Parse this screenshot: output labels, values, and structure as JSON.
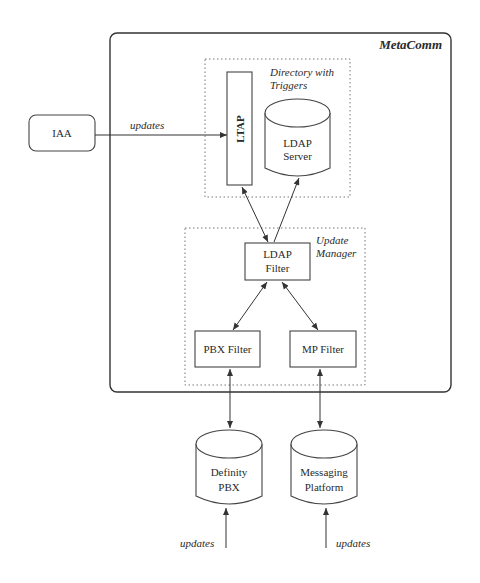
{
  "diagram": {
    "container": {
      "label": "MetaComm"
    },
    "groups": [
      {
        "id": "directory",
        "label_line1": "Directory with",
        "label_line2": "Triggers"
      },
      {
        "id": "update-manager",
        "label_line1": "Update",
        "label_line2": "Manager"
      }
    ],
    "nodes": {
      "iaa": {
        "label": "IAA",
        "shape": "rounded-rect"
      },
      "ltap": {
        "label": "LTAP",
        "shape": "rect-vertical-text"
      },
      "ldap_server": {
        "line1": "LDAP",
        "line2": "Server",
        "shape": "cylinder"
      },
      "ldap_filter": {
        "line1": "LDAP",
        "line2": "Filter",
        "shape": "rect"
      },
      "pbx_filter": {
        "label": "PBX Filter",
        "shape": "rect"
      },
      "mp_filter": {
        "label": "MP Filter",
        "shape": "rect"
      },
      "definity": {
        "line1": "Definity",
        "line2": "PBX",
        "shape": "cylinder"
      },
      "messaging": {
        "line1": "Messaging",
        "line2": "Platform",
        "shape": "cylinder"
      }
    },
    "edges": [
      {
        "from": "IAA",
        "to": "LTAP",
        "label": "updates",
        "direction": "forward"
      },
      {
        "from": "LTAP",
        "to": "LDAP Filter",
        "direction": "both"
      },
      {
        "from": "LDAP Server",
        "to": "LDAP Filter",
        "direction": "both"
      },
      {
        "from": "LDAP Filter",
        "to": "PBX Filter",
        "direction": "both"
      },
      {
        "from": "LDAP Filter",
        "to": "MP Filter",
        "direction": "both"
      },
      {
        "from": "PBX Filter",
        "to": "Definity PBX",
        "direction": "both"
      },
      {
        "from": "MP Filter",
        "to": "Messaging Platform",
        "direction": "both"
      },
      {
        "from": "external",
        "to": "Definity PBX",
        "label": "updates",
        "direction": "forward"
      },
      {
        "from": "external",
        "to": "Messaging Platform",
        "label": "updates",
        "direction": "forward"
      }
    ],
    "edge_labels": {
      "iaa_updates": "updates",
      "pbx_updates": "updates",
      "mp_updates": "updates"
    }
  }
}
